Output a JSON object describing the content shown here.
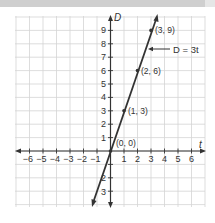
{
  "chart_data": {
    "type": "line",
    "title": "",
    "xlabel": "t",
    "ylabel": "D",
    "xlim": [
      -6.9,
      7.1
    ],
    "ylim": [
      -4.2,
      10.0
    ],
    "grid": true,
    "x_ticks": [
      -6,
      -5,
      -4,
      -3,
      -2,
      -1,
      1,
      2,
      3,
      4,
      5,
      6
    ],
    "y_ticks": [
      -3,
      -2,
      1,
      2,
      3,
      4,
      5,
      6,
      7,
      8,
      9
    ],
    "series": [
      {
        "name": "D = 3t",
        "equation": "D = 3t",
        "line_extent": {
          "from": [
            -1.3,
            -3.9
          ],
          "to": [
            3.4,
            10.2
          ]
        },
        "points": [
          {
            "x": 0,
            "y": 0,
            "label": "(0, 0)"
          },
          {
            "x": 1,
            "y": 3,
            "label": "(1, 3)"
          },
          {
            "x": 2,
            "y": 6,
            "label": "(2, 6)"
          },
          {
            "x": 3,
            "y": 9,
            "label": "(3, 9)"
          }
        ]
      }
    ],
    "annotations": [
      {
        "text": "D = 3t",
        "arrow_to_line": true
      }
    ]
  },
  "labels": {
    "x_axis": "t",
    "y_axis": "D",
    "equation": "D = 3t",
    "x_ticks": [
      "−6",
      "−5",
      "−4",
      "−3",
      "−2",
      "−1",
      "1",
      "2",
      "3",
      "4",
      "5",
      "6"
    ],
    "y_ticks_pos": [
      "1",
      "2",
      "3",
      "4",
      "5",
      "6",
      "7",
      "8",
      "9"
    ],
    "y_ticks_neg": [
      "2",
      "3"
    ],
    "points": [
      "(0, 0)",
      "(1, 3)",
      "(2, 6)",
      "(3, 9)"
    ]
  }
}
